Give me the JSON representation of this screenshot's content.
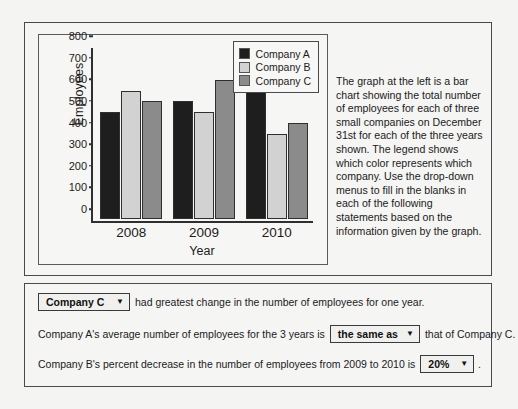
{
  "chart_data": {
    "type": "bar",
    "title": "",
    "xlabel": "Year",
    "ylabel": "Employees",
    "categories": [
      "2008",
      "2009",
      "2010"
    ],
    "series": [
      {
        "name": "Company A",
        "color": "#1e1e1e",
        "values": [
          500,
          550,
          600
        ]
      },
      {
        "name": "Company B",
        "color": "#d2d2d2",
        "values": [
          600,
          500,
          400
        ]
      },
      {
        "name": "Company C",
        "color": "#8b8b8b",
        "values": [
          550,
          650,
          450
        ]
      }
    ],
    "ylim": [
      0,
      800
    ],
    "yticks": [
      0,
      100,
      200,
      300,
      400,
      500,
      600,
      700,
      800
    ],
    "grid": false,
    "legend_position": "top-right"
  },
  "description": {
    "text": "The graph at the left is a bar chart showing the total number of employees for each of three small companies on December 31st for each of the three years shown. The legend shows which color represents which company. Use the drop-down menus to fill in the blanks in each of the following statements based on the information given by the graph."
  },
  "statements": [
    {
      "dropdown_value": "Company C",
      "before": "",
      "after": "had greatest change in the number of employees for one year."
    },
    {
      "dropdown_value": "the same as",
      "before": "Company A's average number of employees for the 3 years is",
      "after": "that of Company C."
    },
    {
      "dropdown_value": "20%",
      "before": "Company B's percent decrease in the number of employees from 2009 to 2010 is",
      "after": "."
    }
  ],
  "icons": {
    "caret": "▼"
  }
}
